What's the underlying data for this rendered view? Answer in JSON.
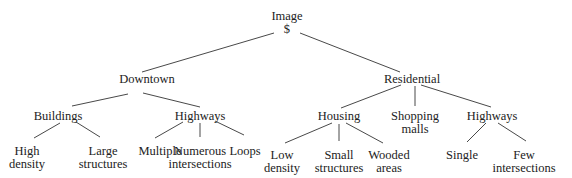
{
  "diagram": {
    "type": "tree",
    "root": {
      "id": "image",
      "label": "Image",
      "sublabel": "$"
    },
    "nodes": [
      {
        "id": "image",
        "lines": [
          "Image",
          "$"
        ],
        "x": 287,
        "y": 10
      },
      {
        "id": "downtown",
        "lines": [
          "Downtown"
        ],
        "x": 147,
        "y": 73
      },
      {
        "id": "residential",
        "lines": [
          "Residential"
        ],
        "x": 412,
        "y": 73
      },
      {
        "id": "buildings",
        "lines": [
          "Buildings"
        ],
        "x": 58,
        "y": 110
      },
      {
        "id": "highways-downtown",
        "lines": [
          "Highways"
        ],
        "x": 200,
        "y": 110
      },
      {
        "id": "housing",
        "lines": [
          "Housing"
        ],
        "x": 339,
        "y": 110
      },
      {
        "id": "shopping-malls",
        "lines": [
          "Shopping",
          "malls"
        ],
        "x": 415,
        "y": 110
      },
      {
        "id": "highways-residential",
        "lines": [
          "Highways"
        ],
        "x": 492,
        "y": 110
      },
      {
        "id": "high-density",
        "lines": [
          "High",
          "density"
        ],
        "x": 27,
        "y": 145
      },
      {
        "id": "large-structures",
        "lines": [
          "Large",
          "structures"
        ],
        "x": 103,
        "y": 145
      },
      {
        "id": "multiple",
        "lines": [
          "Multiple"
        ],
        "x": 160,
        "y": 145
      },
      {
        "id": "numerous-intersections",
        "lines": [
          "Numerous",
          "intersections"
        ],
        "x": 200,
        "y": 145
      },
      {
        "id": "loops",
        "lines": [
          "Loops"
        ],
        "x": 245,
        "y": 145
      },
      {
        "id": "low-density",
        "lines": [
          "Low",
          "density"
        ],
        "x": 282,
        "y": 149
      },
      {
        "id": "small-structures",
        "lines": [
          "Small",
          "structures"
        ],
        "x": 339,
        "y": 149
      },
      {
        "id": "wooded-areas",
        "lines": [
          "Wooded",
          "areas"
        ],
        "x": 389,
        "y": 149
      },
      {
        "id": "single",
        "lines": [
          "Single"
        ],
        "x": 462,
        "y": 149
      },
      {
        "id": "few-intersections",
        "lines": [
          "Few",
          "intersections"
        ],
        "x": 524,
        "y": 149
      }
    ],
    "edges": [
      {
        "from": "image",
        "to": "downtown",
        "x1": 274,
        "y1": 33,
        "x2": 142,
        "y2": 72
      },
      {
        "from": "image",
        "to": "residential",
        "x1": 300,
        "y1": 33,
        "x2": 400,
        "y2": 72
      },
      {
        "from": "downtown",
        "to": "buildings",
        "x1": 128,
        "y1": 94,
        "x2": 72,
        "y2": 106
      },
      {
        "from": "downtown",
        "to": "highways-downtown",
        "x1": 143,
        "y1": 93,
        "x2": 200,
        "y2": 107
      },
      {
        "from": "buildings",
        "to": "high-density",
        "x1": 60,
        "y1": 123,
        "x2": 34,
        "y2": 138
      },
      {
        "from": "buildings",
        "to": "large-structures",
        "x1": 76,
        "y1": 122,
        "x2": 100,
        "y2": 137
      },
      {
        "from": "highways-downtown",
        "to": "multiple",
        "x1": 183,
        "y1": 122,
        "x2": 155,
        "y2": 138
      },
      {
        "from": "highways-downtown",
        "to": "numerous-intersections",
        "x1": 200,
        "y1": 123,
        "x2": 200,
        "y2": 137
      },
      {
        "from": "highways-downtown",
        "to": "loops",
        "x1": 215,
        "y1": 121,
        "x2": 244,
        "y2": 135
      },
      {
        "from": "residential",
        "to": "housing",
        "x1": 401,
        "y1": 85,
        "x2": 341,
        "y2": 108
      },
      {
        "from": "residential",
        "to": "shopping-malls",
        "x1": 415,
        "y1": 86,
        "x2": 415,
        "y2": 106
      },
      {
        "from": "residential",
        "to": "highways-residential",
        "x1": 421,
        "y1": 85,
        "x2": 491,
        "y2": 107
      },
      {
        "from": "housing",
        "to": "low-density",
        "x1": 332,
        "y1": 123,
        "x2": 285,
        "y2": 143
      },
      {
        "from": "housing",
        "to": "small-structures",
        "x1": 339,
        "y1": 124,
        "x2": 339,
        "y2": 141
      },
      {
        "from": "housing",
        "to": "wooded-areas",
        "x1": 346,
        "y1": 123,
        "x2": 383,
        "y2": 143
      },
      {
        "from": "highways-residential",
        "to": "single",
        "x1": 486,
        "y1": 123,
        "x2": 467,
        "y2": 142
      },
      {
        "from": "highways-residential",
        "to": "few-intersections",
        "x1": 498,
        "y1": 123,
        "x2": 526,
        "y2": 141
      }
    ]
  }
}
